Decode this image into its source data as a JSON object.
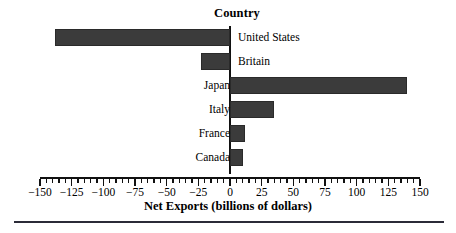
{
  "chart_data": {
    "type": "bar",
    "orientation": "horizontal",
    "title": "Country",
    "xlabel": "Net Exports (billions of dollars)",
    "ylabel": "Country",
    "categories": [
      "United States",
      "Britain",
      "Japan",
      "Italy",
      "France",
      "Canada"
    ],
    "values": [
      -138,
      -23,
      140,
      35,
      12,
      10
    ],
    "xlim": [
      -150,
      150
    ],
    "xticks": [
      -150,
      -125,
      -100,
      -75,
      -50,
      -25,
      0,
      25,
      50,
      75,
      100,
      125,
      150
    ],
    "xtick_labels": [
      "−150",
      "−125",
      "−100",
      "−75",
      "−50",
      "−25",
      "0",
      "25",
      "50",
      "75",
      "100",
      "125",
      "150"
    ],
    "minor_tick_step": 5,
    "grid": false,
    "legend": null,
    "bar_color": "#3b3b3b",
    "axis_color": "#111111",
    "background": "#ffffff",
    "series": [
      {
        "name": "Net Exports",
        "points": [
          {
            "category": "United States",
            "value": -138
          },
          {
            "category": "Britain",
            "value": -23
          },
          {
            "category": "Japan",
            "value": 140
          },
          {
            "category": "Italy",
            "value": 35
          },
          {
            "category": "France",
            "value": 12
          },
          {
            "category": "Canada",
            "value": 10
          }
        ]
      }
    ]
  },
  "figure": {
    "title": "Country",
    "axis_title": "Net Exports (billions of dollars)",
    "rows": [
      {
        "label": "United States",
        "value": -138
      },
      {
        "label": "Britain",
        "value": -23
      },
      {
        "label": "Japan",
        "value": 140
      },
      {
        "label": "Italy",
        "value": 35
      },
      {
        "label": "France",
        "value": 12
      },
      {
        "label": "Canada",
        "value": 10
      }
    ],
    "tick_labels": [
      "−150",
      "−125",
      "−100",
      "−75",
      "−50",
      "−25",
      "0",
      "25",
      "50",
      "75",
      "100",
      "125",
      "150"
    ]
  }
}
